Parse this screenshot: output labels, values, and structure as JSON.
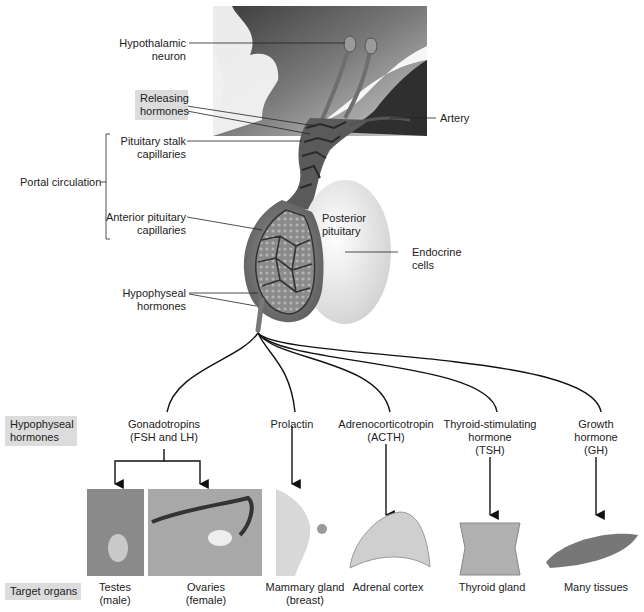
{
  "labels": {
    "hypothalamic_neuron": [
      "Hypothalamic",
      "neuron"
    ],
    "releasing_hormones": [
      "Releasing",
      "hormones"
    ],
    "artery": "Artery",
    "pituitary_stalk_capillaries": [
      "Pituitary stalk",
      "capillaries"
    ],
    "portal_circulation": "Portal circulation",
    "anterior_pituitary_capillaries": [
      "Anterior pituitary",
      "capillaries"
    ],
    "posterior_pituitary": [
      "Posterior",
      "pituitary"
    ],
    "endocrine_cells": [
      "Endocrine",
      "cells"
    ],
    "hypophyseal_hormones_top": [
      "Hypophyseal",
      "hormones"
    ]
  },
  "row_labels": {
    "hormones": [
      "Hypophyseal",
      "hormones"
    ],
    "targets": "Target organs"
  },
  "hormones": [
    {
      "name": [
        "Gonadotropins",
        "(FSH and LH)"
      ]
    },
    {
      "name": [
        "Prolactin"
      ]
    },
    {
      "name": [
        "Adrenocorticotropin",
        "(ACTH)"
      ]
    },
    {
      "name": [
        "Thyroid-stimulating",
        "hormone",
        "(TSH)"
      ]
    },
    {
      "name": [
        "Growth",
        "hormone",
        "(GH)"
      ]
    }
  ],
  "targets": [
    {
      "name": [
        "Testes",
        "(male)"
      ]
    },
    {
      "name": [
        "Ovaries",
        "(female)"
      ]
    },
    {
      "name": [
        "Mammary gland",
        "(breast)"
      ]
    },
    {
      "name": [
        "Adrenal cortex"
      ]
    },
    {
      "name": [
        "Thyroid gland"
      ]
    },
    {
      "name": [
        "Many tissues"
      ]
    }
  ],
  "colors": {
    "label_box": "#dcdcdc",
    "line": "#111111",
    "tissue_dark": "#4a4a4a",
    "tissue_light": "#f2f2f2"
  }
}
